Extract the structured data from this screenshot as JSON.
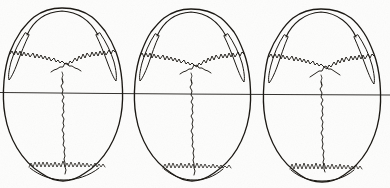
{
  "plate": {
    "title": "Norma verticalis — three crania with cranial sutures",
    "description": "Line drawing of three human skulls seen from above, each showing coronal, sagittal and lambdoid sutures, crossed by a single horizontal reference line.",
    "width": 390,
    "height": 188,
    "background_color": "#fdfdfc",
    "ink_color": "#17140f",
    "view": "superior (norma verticalis)",
    "specimen_count": 3
  },
  "reference_line": {
    "name": "horizontal reference line",
    "orientation": "horizontal",
    "x_start": 0,
    "x_end": 390,
    "y_left": 92.5,
    "y_right": 95.0,
    "color": "#1b1815"
  },
  "specimens": [
    {
      "label": "1",
      "center_x": 63,
      "top_y": 8,
      "bottom_y": 182,
      "half_width": 59,
      "bregma": {
        "x": 62,
        "y": 79
      },
      "lambda": {
        "x": 64,
        "y": 160
      },
      "sutures": [
        "coronal",
        "sagittal",
        "lambdoid"
      ]
    },
    {
      "label": "2",
      "center_x": 192,
      "top_y": 9,
      "bottom_y": 181,
      "half_width": 57,
      "bregma": {
        "x": 191,
        "y": 80
      },
      "lambda": {
        "x": 193,
        "y": 161
      },
      "sutures": [
        "coronal",
        "sagittal",
        "lambdoid"
      ]
    },
    {
      "label": "3",
      "center_x": 322,
      "top_y": 9,
      "bottom_y": 182,
      "half_width": 58,
      "bregma": {
        "x": 321,
        "y": 82
      },
      "lambda": {
        "x": 323,
        "y": 161
      },
      "sutures": [
        "coronal",
        "sagittal",
        "lambdoid"
      ]
    }
  ],
  "features": {
    "cranial_vault": "cranial vault outline",
    "temporal_sliver": "temporal / zygomatic arch sliver",
    "coronal_suture": "coronal suture",
    "sagittal_suture": "sagittal suture",
    "lambdoid_suture": "lambdoid suture",
    "occipital_margin": "occipital margin"
  }
}
